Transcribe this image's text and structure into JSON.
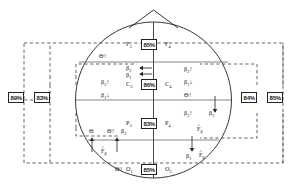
{
  "diagram": {
    "type": "head-map-schematic",
    "colors": {
      "line": "#222222",
      "dashed": "#444444",
      "box_border": "#222222",
      "background": "#ffffff"
    },
    "head_outline": {
      "shape": "circle-with-nose",
      "nose": "triangle-at-top"
    },
    "electrode_sites": [
      {
        "id": "F3",
        "label": "F",
        "sub": "3",
        "pct": "85%",
        "pair": "F4",
        "pair_label": "F",
        "pair_sub": "4",
        "region": "frontal"
      },
      {
        "id": "C3",
        "label": "C",
        "sub": "3",
        "pct": "86%",
        "pair": "C4",
        "pair_label": "C",
        "pair_sub": "4",
        "region": "central"
      },
      {
        "id": "P3",
        "label": "P",
        "sub": "3",
        "pct": "83%",
        "pair": "P4",
        "pair_label": "P",
        "pair_sub": "4",
        "region": "parietal"
      },
      {
        "id": "O1",
        "label": "O",
        "sub": "1",
        "pct": "85%",
        "pair": "O2",
        "pair_label": "O",
        "pair_sub": "2",
        "region": "occipital"
      }
    ],
    "side_boxes": {
      "left": [
        {
          "id": "left-outer",
          "pct": "89%"
        },
        {
          "id": "left-inner",
          "pct": "83%"
        }
      ],
      "right": [
        {
          "id": "right-inner",
          "pct": "84%"
        },
        {
          "id": "right-outer",
          "pct": "85%"
        }
      ]
    },
    "annotations": [
      {
        "id": "ann-theta-upper-left",
        "symbol": "Θ",
        "sub": "",
        "arrow": "↑",
        "hat": false
      },
      {
        "id": "ann-beta2-top-center",
        "symbol": "β",
        "sub": "2",
        "arrow": "←",
        "hat": false
      },
      {
        "id": "ann-beta1-top-center",
        "symbol": "β",
        "sub": "1",
        "arrow": "←",
        "hat": false
      },
      {
        "id": "ann-beta2-left-mid",
        "symbol": "β",
        "sub": "2",
        "arrow": "↑",
        "hat": false
      },
      {
        "id": "ann-beta1-left-mid",
        "symbol": "β",
        "sub": "1",
        "arrow": "↓",
        "hat": false
      },
      {
        "id": "ann-beta2-right-upper",
        "symbol": "β",
        "sub": "2",
        "arrow": "↑",
        "hat": false
      },
      {
        "id": "ann-beta1-right-upper",
        "symbol": "β",
        "sub": "1",
        "arrow": "↓",
        "hat": false
      },
      {
        "id": "ann-theta-right-mid",
        "symbol": "Θ",
        "sub": "",
        "arrow": "↑",
        "hat": false
      },
      {
        "id": "ann-beta2-right-lower",
        "symbol": "β",
        "sub": "2",
        "arrow": "↑",
        "hat": false
      },
      {
        "id": "ann-beta2-right-edge",
        "symbol": "β",
        "sub": "2",
        "arrow": "",
        "hat": false
      },
      {
        "id": "ann-fhat-right-mid",
        "symbol": "F",
        "sub": "β",
        "arrow": "",
        "hat": true
      },
      {
        "id": "ann-theta-lower-left-1",
        "symbol": "Θ",
        "sub": "",
        "arrow": "",
        "hat": false
      },
      {
        "id": "ann-theta-lower-left-2",
        "symbol": "Θ",
        "sub": "",
        "arrow": "↑",
        "hat": false
      },
      {
        "id": "ann-beta2-lower-left",
        "symbol": "β",
        "sub": "2",
        "arrow": "",
        "hat": false
      },
      {
        "id": "ann-fhat-lower-left",
        "symbol": "F",
        "sub": "β",
        "arrow": "",
        "hat": true
      },
      {
        "id": "ann-theta-bottom",
        "symbol": "Θ",
        "sub": "",
        "arrow": "↑",
        "hat": false
      },
      {
        "id": "ann-beta1-bottom-right",
        "symbol": "β",
        "sub": "1",
        "arrow": "",
        "hat": false
      },
      {
        "id": "ann-fhat-bottom-right",
        "symbol": "F",
        "sub": "β",
        "arrow": "",
        "hat": true
      }
    ]
  }
}
